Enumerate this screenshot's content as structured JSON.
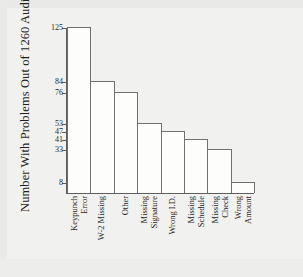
{
  "chart_data": {
    "type": "bar",
    "title": "",
    "subtitle": "",
    "xlabel": "",
    "ylabel": "Number With Problems Out of 1260 Audits",
    "ylim": [
      0,
      125
    ],
    "grid": false,
    "legend": false,
    "legend_position": "none",
    "orientation": "vertical",
    "bar_style": {
      "fill": "#fdfdfc",
      "edge": "#707070"
    },
    "categories": [
      "Keypunch Error",
      "W-2 Missing",
      "Other",
      "Missing Signature",
      "Wrong I.D.",
      "Missing Schedule",
      "Missing Check",
      "Wrong Amount"
    ],
    "category_lines": [
      [
        "Keypunch",
        "Error"
      ],
      [
        "W-2 Missing",
        ""
      ],
      [
        "Other",
        ""
      ],
      [
        "Missing",
        "Signature"
      ],
      [
        "Wrong I.D.",
        ""
      ],
      [
        "Missing",
        "Schedule"
      ],
      [
        "Missing",
        "Check"
      ],
      [
        "Wrong",
        "Amount"
      ]
    ],
    "values": [
      125,
      84,
      76,
      53,
      47,
      41,
      33,
      8
    ],
    "ytick_labels": [
      "125",
      "84",
      "76",
      "53",
      "47",
      "41",
      "33",
      "8"
    ],
    "ytick_values": [
      125,
      84,
      76,
      53,
      47,
      41,
      33,
      8
    ],
    "total_audits": 1260
  },
  "figure": {
    "background_color": "#f1f1ef",
    "axis_color": "#5d5d5d",
    "text_color": "#1e1e1e"
  }
}
